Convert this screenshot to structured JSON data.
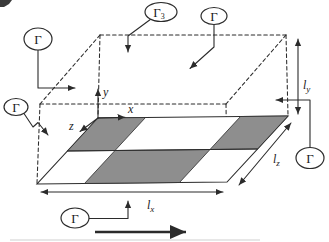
{
  "diagram": {
    "boundary_tags": [
      {
        "pos": "top-left",
        "text": "Γ",
        "sub": ""
      },
      {
        "pos": "top-center",
        "text": "Γ",
        "sub": "3"
      },
      {
        "pos": "top-right",
        "text": "Γ",
        "sub": ""
      },
      {
        "pos": "left",
        "text": "Γ",
        "sub": ""
      },
      {
        "pos": "right",
        "text": "Γ",
        "sub": ""
      },
      {
        "pos": "bottom",
        "text": "Γ",
        "sub": ""
      }
    ],
    "axes": {
      "x": "x",
      "y": "y",
      "z": "z"
    },
    "dimensions": {
      "lx": {
        "base": "l",
        "sub": "x"
      },
      "ly": {
        "base": "l",
        "sub": "y"
      },
      "lz": {
        "base": "l",
        "sub": "z"
      }
    },
    "colors": {
      "dark_cell": "#8e8e8e",
      "plate_light": "#ffffff",
      "line": "#2b2b2b",
      "background": "#ffffff"
    }
  }
}
